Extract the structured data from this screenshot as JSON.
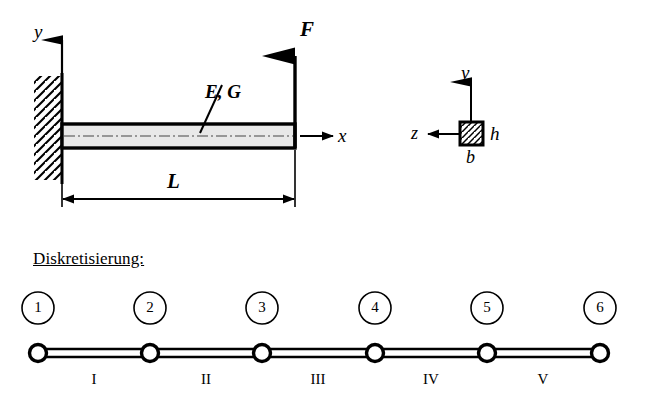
{
  "figure": {
    "title_section_label": "Diskretisierung:",
    "beam_model": {
      "axes": [
        {
          "name": "y-axis",
          "label": "y",
          "direction": "up"
        },
        {
          "name": "x-axis",
          "label": "x",
          "direction": "right"
        }
      ],
      "force_label": "F",
      "material_label": "E, G",
      "length_label": "L",
      "support_type": "fixed-wall-hatched"
    },
    "cross_section": {
      "axis_vertical_label": "y",
      "axis_horizontal_label": "z",
      "height_label": "h",
      "width_label": "b",
      "fill": "hatched"
    },
    "discretization": {
      "nodes": [
        {
          "id": "1",
          "label": "1"
        },
        {
          "id": "2",
          "label": "2"
        },
        {
          "id": "3",
          "label": "3"
        },
        {
          "id": "4",
          "label": "4"
        },
        {
          "id": "5",
          "label": "5"
        },
        {
          "id": "6",
          "label": "6"
        }
      ],
      "elements": [
        {
          "id": "I",
          "label": "I"
        },
        {
          "id": "II",
          "label": "II"
        },
        {
          "id": "III",
          "label": "III"
        },
        {
          "id": "IV",
          "label": "IV"
        },
        {
          "id": "V",
          "label": "V"
        }
      ]
    }
  },
  "colors": {
    "stroke": "#000000",
    "beam_fill": "#e8e8e8",
    "background": "#ffffff"
  }
}
